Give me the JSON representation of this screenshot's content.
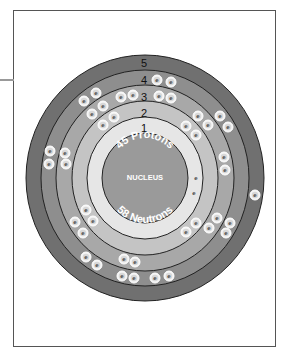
{
  "diagram": {
    "nucleus": {
      "label": "NUCLEUS",
      "protons_label": "45 Protons",
      "neutrons_label": "58 Neutrons",
      "color": "#9a9a9a"
    },
    "shells": [
      {
        "number": "1",
        "color": "#e6e6e6",
        "electrons": 2
      },
      {
        "number": "2",
        "color": "#c4c4c4",
        "electrons": 8
      },
      {
        "number": "3",
        "color": "#a8a8a8",
        "electrons": 18
      },
      {
        "number": "4",
        "color": "#8e8e8e",
        "electrons": 16
      },
      {
        "number": "5",
        "color": "#707070",
        "electrons": 1
      }
    ],
    "electron_symbol": "e"
  }
}
